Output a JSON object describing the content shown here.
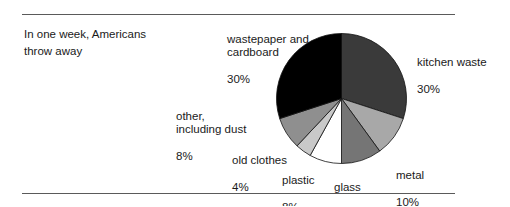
{
  "figure": {
    "caption": "In one week, Americans\nthrow away",
    "rule_color": "#5a5a5a"
  },
  "chart_data": {
    "type": "pie",
    "title": "In one week, Americans throw away",
    "xlabel": "",
    "ylabel": "",
    "legend": "none",
    "labels_inline": true,
    "start_angle_deg": 0,
    "direction": "clockwise",
    "categories": [
      "kitchen waste",
      "metal",
      "glass",
      "plastic",
      "old clothes",
      "other, including dust",
      "wastepaper and cardboard"
    ],
    "values": [
      30,
      10,
      10,
      8,
      4,
      8,
      30
    ],
    "unit": "%",
    "colors": [
      "#3a3a3a",
      "#a8a8a8",
      "#757575",
      "#ffffff",
      "#c9c9c9",
      "#8f8f8f",
      "#000000"
    ],
    "slices": [
      {
        "name": "kitchen waste",
        "label": "kitchen waste",
        "percent": 30,
        "percent_text": "30%",
        "color": "#3a3a3a"
      },
      {
        "name": "metal",
        "label": "metal",
        "percent": 10,
        "percent_text": "10%",
        "color": "#a8a8a8"
      },
      {
        "name": "glass",
        "label": "glass",
        "percent": 10,
        "percent_text": "10%",
        "color": "#757575"
      },
      {
        "name": "plastic",
        "label": "plastic",
        "percent": 8,
        "percent_text": "8%",
        "color": "#ffffff"
      },
      {
        "name": "old clothes",
        "label": "old clothes",
        "percent": 4,
        "percent_text": "4%",
        "color": "#c9c9c9"
      },
      {
        "name": "other including dust",
        "label": "other,\nincluding dust",
        "percent": 8,
        "percent_text": "8%",
        "color": "#8f8f8f"
      },
      {
        "name": "wastepaper and cardboard",
        "label": "wastepaper and\ncardboard",
        "percent": 30,
        "percent_text": "30%",
        "color": "#000000"
      }
    ]
  }
}
